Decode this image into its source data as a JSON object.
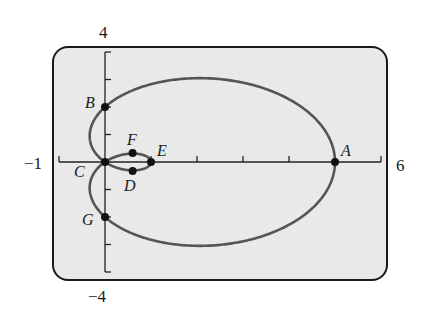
{
  "chart_data": {
    "type": "line",
    "title": "",
    "subtitle": "Polar graph of a limaçon with inner loop (r = 2 + 3 cos θ)",
    "xlabel": "",
    "ylabel": "",
    "xlim": [
      -1,
      6
    ],
    "ylim": [
      -4,
      4
    ],
    "x_tick_step": 1,
    "y_tick_step": 1,
    "grid": false,
    "legend": null,
    "axis_labels": {
      "y_max": "4",
      "y_min": "−4",
      "x_min": "−1",
      "x_max": "6"
    },
    "series": [
      {
        "name": "limaçon",
        "equation": "r = 2 + 3cos(θ)",
        "color": "#555555"
      }
    ],
    "points": [
      {
        "label": "A",
        "x": 5,
        "y": 0
      },
      {
        "label": "B",
        "x": 0,
        "y": 2
      },
      {
        "label": "C",
        "x": 0,
        "y": 0
      },
      {
        "label": "D",
        "x": 0.6,
        "y": -0.33
      },
      {
        "label": "E",
        "x": 1,
        "y": 0
      },
      {
        "label": "F",
        "x": 0.6,
        "y": 0.33
      },
      {
        "label": "G",
        "x": 0,
        "y": -2
      }
    ]
  },
  "colors": {
    "screen_bg": "#e9e9e9",
    "frame": "#1a1a1a",
    "curve": "#555555",
    "axis": "#222222",
    "point": "#111111"
  }
}
